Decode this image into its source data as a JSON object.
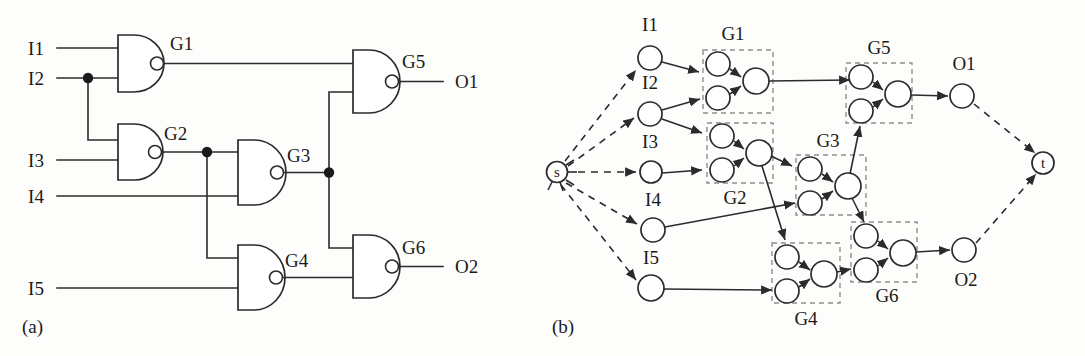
{
  "figure": {
    "panels": [
      {
        "id": "a",
        "caption": "(a)",
        "description": "combinational logic circuit of six NAND gates"
      },
      {
        "id": "b",
        "caption": "(b)",
        "description": "equivalent s-t flow graph with gate clusters"
      }
    ]
  },
  "circuit": {
    "inputs": [
      "I1",
      "I2",
      "I3",
      "I4",
      "I5"
    ],
    "outputs": [
      "O1",
      "O2"
    ],
    "gates": [
      {
        "name": "G1",
        "type": "NAND",
        "inputs": [
          "I1",
          "I2"
        ],
        "output": "n1"
      },
      {
        "name": "G2",
        "type": "NAND",
        "inputs": [
          "I2",
          "I3"
        ],
        "output": "n2"
      },
      {
        "name": "G3",
        "type": "NAND",
        "inputs": [
          "n2",
          "I4"
        ],
        "output": "n3"
      },
      {
        "name": "G4",
        "type": "NAND",
        "inputs": [
          "n2",
          "I5"
        ],
        "output": "n4"
      },
      {
        "name": "G5",
        "type": "NAND",
        "inputs": [
          "n1",
          "n3"
        ],
        "output": "O1"
      },
      {
        "name": "G6",
        "type": "NAND",
        "inputs": [
          "n3",
          "n4"
        ],
        "output": "O2"
      }
    ],
    "junctions": [
      "I2-fanout",
      "G2-fanout",
      "G3-fanout"
    ]
  },
  "graph": {
    "source_node": "s",
    "sink_node": "t",
    "input_nodes": [
      "I1",
      "I2",
      "I3",
      "I4",
      "I5"
    ],
    "output_nodes": [
      "O1",
      "O2"
    ],
    "clusters": [
      "G1",
      "G2",
      "G3",
      "G4",
      "G5",
      "G6"
    ],
    "cluster_label_positions": {
      "G1": "above",
      "G2": "below",
      "G3": "above",
      "G4": "below",
      "G5": "above",
      "G6": "below"
    }
  },
  "labels": {
    "a_I1": "I1",
    "a_I2": "I2",
    "a_I3": "I3",
    "a_I4": "I4",
    "a_I5": "I5",
    "a_G1": "G1",
    "a_G2": "G2",
    "a_G3": "G3",
    "a_G4": "G4",
    "a_G5": "G5",
    "a_G6": "G6",
    "a_O1": "O1",
    "a_O2": "O2",
    "a_caption": "(a)",
    "b_I1": "I1",
    "b_I2": "I2",
    "b_I3": "I3",
    "b_I4": "I4",
    "b_I5": "I5",
    "b_G1": "G1",
    "b_G2": "G2",
    "b_G3": "G3",
    "b_G4": "G4",
    "b_G5": "G5",
    "b_G6": "G6",
    "b_O1": "O1",
    "b_O2": "O2",
    "b_s": "s",
    "b_t": "t",
    "b_caption": "(b)"
  },
  "colors": {
    "ink": "#1a1a1a",
    "wire": "#2b2b2b",
    "cluster_dash": "#8d8d8d",
    "background": "#fdfdfb"
  }
}
